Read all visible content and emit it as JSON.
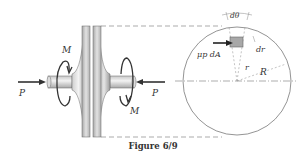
{
  "figure": {
    "caption": "Figure 6/9",
    "labels": {
      "force_left": "P",
      "force_right": "P",
      "moment_left": "M",
      "moment_right": "M",
      "dtheta": "dθ",
      "friction": "μp dA",
      "dr": "dr",
      "r": "r",
      "R": "R"
    },
    "colors": {
      "line": "#444444",
      "disk_light": "#e8e8e8",
      "disk_dark": "#9a9a9a",
      "element_fill": "#a8a8a8"
    }
  }
}
